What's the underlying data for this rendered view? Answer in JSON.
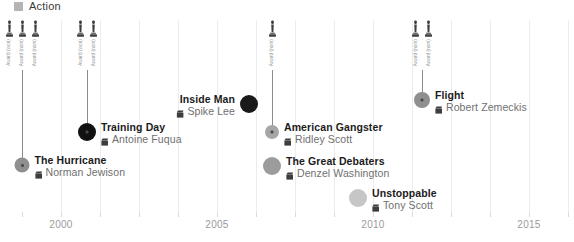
{
  "legend": {
    "label": "Action",
    "color": "#b4b4b4"
  },
  "axis": {
    "ticks": [
      {
        "year": "",
        "x": 22
      },
      {
        "year": "2000",
        "x": 61
      },
      {
        "year": "",
        "x": 100
      },
      {
        "year": "",
        "x": 139
      },
      {
        "year": "",
        "x": 178
      },
      {
        "year": "2005",
        "x": 217
      },
      {
        "year": "",
        "x": 256
      },
      {
        "year": "",
        "x": 295
      },
      {
        "year": "",
        "x": 334
      },
      {
        "year": "2010",
        "x": 373
      },
      {
        "year": "",
        "x": 412
      },
      {
        "year": "",
        "x": 451
      },
      {
        "year": "",
        "x": 490
      },
      {
        "year": "2015",
        "x": 529
      },
      {
        "year": "",
        "x": 568
      }
    ],
    "gridlines": [
      61,
      100,
      139,
      178,
      217,
      256,
      295,
      334,
      373,
      412,
      451,
      490,
      529,
      568
    ],
    "range": [
      "1999",
      "2015"
    ]
  },
  "chart_data": {
    "type": "scatter",
    "title": "",
    "xlabel": "",
    "ylabel": "",
    "legend": [
      "Action"
    ],
    "xlim": [
      "1999",
      "2016"
    ],
    "grid": true,
    "events": [
      {
        "title": "The Hurricane",
        "director": "Norman Jewison",
        "year": 1999,
        "x": 22,
        "y": 165,
        "radius": 7.5,
        "color": "#8f8f8f",
        "label_side": "right",
        "has_pin": true,
        "stem_top": 70,
        "awards": [
          {
            "icon": "award-statuette",
            "text": "Award\n(won)"
          },
          {
            "icon": "award-statuette",
            "text": "Award\n(nom)"
          },
          {
            "icon": "award-statuette",
            "text": "Award\n(nom)"
          }
        ]
      },
      {
        "title": "Training Day",
        "director": "Antoine Fuqua",
        "year": 2001,
        "x": 87,
        "y": 132,
        "radius": 9,
        "color": "#111111",
        "label_side": "right",
        "has_pin": true,
        "stem_top": 70,
        "awards": [
          {
            "icon": "award-statuette",
            "text": "Award\n(won)"
          },
          {
            "icon": "award-statuette",
            "text": "Award\n(nom)"
          }
        ]
      },
      {
        "title": "Inside Man",
        "director": "Spike Lee",
        "year": 2006,
        "x": 249,
        "y": 104,
        "radius": 9,
        "color": "#1a1a1a",
        "label_side": "left",
        "has_pin": false,
        "stem_top": null,
        "awards": []
      },
      {
        "title": "American Gangster",
        "director": "Ridley Scott",
        "year": 2007,
        "x": 272,
        "y": 132,
        "radius": 7,
        "color": "#a6a6a6",
        "label_side": "right",
        "has_pin": true,
        "stem_top": 70,
        "awards": [
          {
            "icon": "award-statuette",
            "text": "Award\n(nom)"
          }
        ]
      },
      {
        "title": "The Great Debaters",
        "director": "Denzel Washington",
        "year": 2007,
        "x": 272,
        "y": 166,
        "radius": 9,
        "color": "#9c9c9c",
        "label_side": "right",
        "has_pin": false,
        "stem_top": null,
        "awards": []
      },
      {
        "title": "Unstoppable",
        "director": "Tony Scott",
        "year": 2010,
        "x": 358,
        "y": 198,
        "radius": 9,
        "color": "#c6c6c6",
        "label_side": "right",
        "has_pin": false,
        "stem_top": null,
        "awards": []
      },
      {
        "title": "Flight",
        "director": "Robert Zemeckis",
        "year": 2012,
        "x": 422,
        "y": 100,
        "radius": 8,
        "color": "#8f8f8f",
        "label_side": "right",
        "has_pin": true,
        "stem_top": 70,
        "awards": [
          {
            "icon": "award-statuette",
            "text": "Award\n(nom)"
          },
          {
            "icon": "award-statuette",
            "text": "Award\n(nom)"
          }
        ]
      }
    ]
  }
}
